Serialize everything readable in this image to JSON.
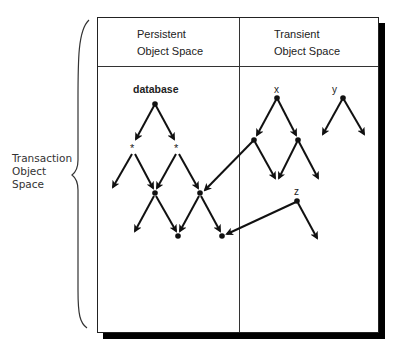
{
  "diagram": {
    "title": "Transaction Object Space",
    "side_label": {
      "lines": [
        "Transaction",
        "Object",
        "Space"
      ]
    },
    "columns": [
      {
        "name": "persistent",
        "header_lines": [
          "Persistent",
          "Object Space"
        ]
      },
      {
        "name": "transient",
        "header_lines": [
          "Transient",
          "Object Space"
        ]
      }
    ],
    "node_labels": {
      "database": "database",
      "x": "x",
      "y": "y",
      "z": "z",
      "star_left": "*",
      "star_right": "*"
    },
    "colors": {
      "line": "#111111",
      "border": "#222222",
      "shadow": "#000000",
      "background": "#ffffff"
    },
    "nodes": [
      {
        "id": "database",
        "x": 155,
        "y": 104
      },
      {
        "id": "star_left",
        "x": 133,
        "y": 149
      },
      {
        "id": "star_right",
        "x": 177,
        "y": 149
      },
      {
        "id": "p_mid_left",
        "x": 155,
        "y": 193
      },
      {
        "id": "p_mid_right",
        "x": 200,
        "y": 193
      },
      {
        "id": "p_bot_left",
        "x": 178,
        "y": 236
      },
      {
        "id": "p_bot_right",
        "x": 222,
        "y": 236
      },
      {
        "id": "x",
        "x": 277,
        "y": 98
      },
      {
        "id": "x_left",
        "x": 254,
        "y": 140
      },
      {
        "id": "x_right",
        "x": 298,
        "y": 140
      },
      {
        "id": "y",
        "x": 343,
        "y": 98
      },
      {
        "id": "z",
        "x": 297,
        "y": 201
      }
    ],
    "edges": [
      {
        "from": "database",
        "to": "star_left"
      },
      {
        "from": "database",
        "to": "star_right"
      },
      {
        "from": "star_left",
        "to": "dangling",
        "end": [
          113,
          187
        ]
      },
      {
        "from": "star_left",
        "to": "p_mid_left"
      },
      {
        "from": "star_right",
        "to": "p_mid_left"
      },
      {
        "from": "star_right",
        "to": "p_mid_right"
      },
      {
        "from": "p_mid_left",
        "to": "dangling",
        "end": [
          135,
          231
        ]
      },
      {
        "from": "p_mid_left",
        "to": "p_bot_left"
      },
      {
        "from": "p_mid_right",
        "to": "p_bot_left"
      },
      {
        "from": "p_mid_right",
        "to": "p_bot_right"
      },
      {
        "from": "x",
        "to": "x_left"
      },
      {
        "from": "x",
        "to": "x_right"
      },
      {
        "from": "x_left",
        "to": "dangling",
        "end": [
          275,
          178
        ]
      },
      {
        "from": "x_left",
        "to": "p_mid_right",
        "cross_space": true
      },
      {
        "from": "x_right",
        "to": "dangling",
        "end": [
          279,
          178
        ]
      },
      {
        "from": "x_right",
        "to": "dangling",
        "end": [
          318,
          178
        ]
      },
      {
        "from": "y",
        "to": "dangling",
        "end": [
          323,
          134
        ]
      },
      {
        "from": "y",
        "to": "dangling",
        "end": [
          364,
          134
        ]
      },
      {
        "from": "z",
        "to": "p_bot_right",
        "cross_space": true
      },
      {
        "from": "z",
        "to": "dangling",
        "end": [
          317,
          238
        ]
      }
    ]
  }
}
